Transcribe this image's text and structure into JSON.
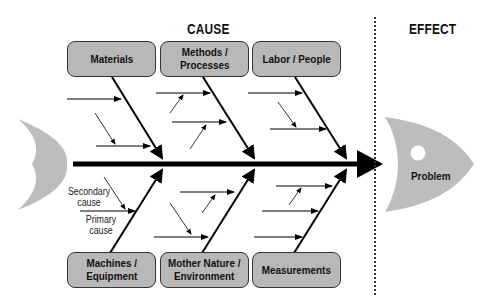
{
  "headers": {
    "cause": "CAUSE",
    "effect": "EFFECT"
  },
  "categories": {
    "top": [
      {
        "label": "Materials"
      },
      {
        "label": "Methods /\nProcesses"
      },
      {
        "label": "Labor / People"
      }
    ],
    "bottom": [
      {
        "label": "Machines /\nEquipment"
      },
      {
        "label": "Mother Nature /\nEnvironment"
      },
      {
        "label": "Measurements"
      }
    ]
  },
  "annotations": {
    "secondary_cause": "Secondary\ncause",
    "primary_cause": "Primary\ncause"
  },
  "effect": {
    "label": "Problem"
  },
  "colors": {
    "box_fill": "#b8b8b8",
    "fish_fill": "#bdbdbd",
    "line": "#000000"
  }
}
